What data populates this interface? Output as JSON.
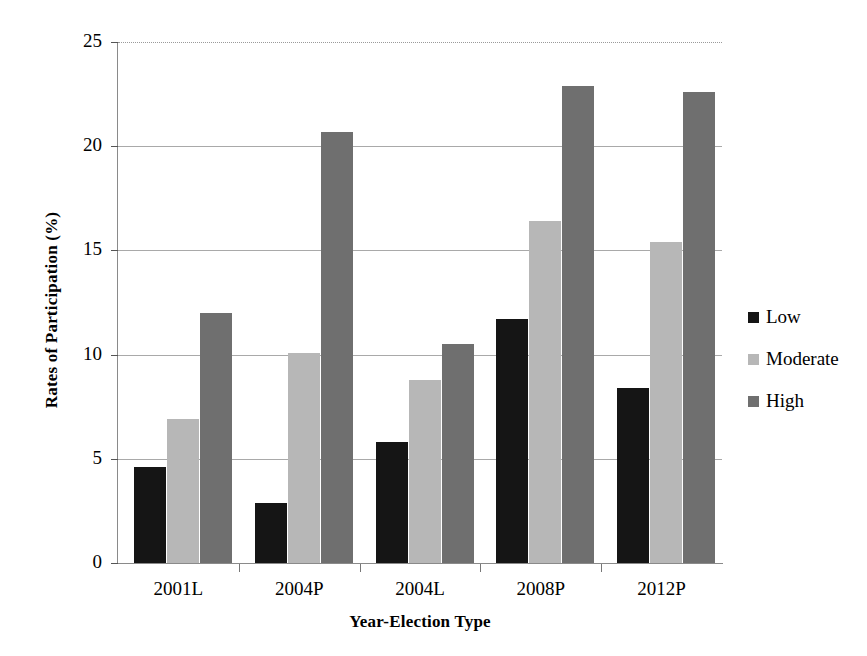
{
  "chart_data": {
    "type": "bar",
    "title": "",
    "subtitle": "",
    "xlabel": "Year-Election Type",
    "ylabel": "Rates of Participation (%)",
    "categories": [
      "2001L",
      "2004P",
      "2004L",
      "2008P",
      "2012P"
    ],
    "series": [
      {
        "name": "Low",
        "color": "#151515",
        "values": [
          4.6,
          2.9,
          5.8,
          11.7,
          8.4
        ]
      },
      {
        "name": "Moderate",
        "color": "#b7b7b7",
        "values": [
          6.9,
          10.1,
          8.8,
          16.4,
          15.4
        ]
      },
      {
        "name": "High",
        "color": "#6f6f6f",
        "values": [
          12.0,
          20.7,
          10.5,
          22.9,
          22.6
        ]
      }
    ],
    "ylim": [
      0,
      25
    ],
    "yticks": [
      0,
      5,
      10,
      15,
      20,
      25
    ],
    "ytick_labels": [
      "0",
      "5",
      "10",
      "15",
      "20",
      "25"
    ],
    "grid": "horizontal",
    "legend_position": "right",
    "legend_entries": [
      "Low",
      "Moderate",
      "High"
    ]
  }
}
